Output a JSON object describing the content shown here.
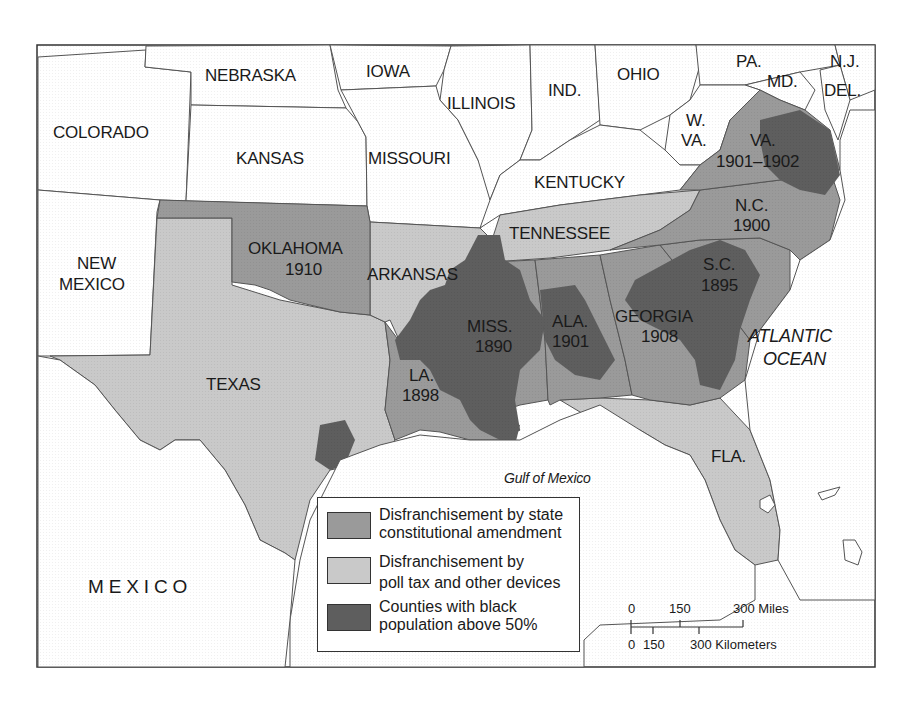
{
  "colors": {
    "constitutional_amendment": "#9a9a9a",
    "poll_tax": "#c9c9c9",
    "black_majority": "#5e5e5e",
    "non_south": "#ffffff",
    "water": "#ffffff",
    "border": "#333333"
  },
  "states": {
    "colorado": "COLORADO",
    "nebraska": "NEBRASKA",
    "iowa": "IOWA",
    "illinois": "ILLINOIS",
    "indiana": "IND.",
    "ohio": "OHIO",
    "pennsylvania": "PA.",
    "maryland": "MD.",
    "new_jersey": "N.J.",
    "delaware": "DEL.",
    "kansas": "KANSAS",
    "missouri": "MISSOURI",
    "west_virginia_1": "W.",
    "west_virginia_2": "VA.",
    "kentucky": "KENTUCKY",
    "virginia": "VA.",
    "virginia_year": "1901–1902",
    "new_mexico_1": "NEW",
    "new_mexico_2": "MEXICO",
    "oklahoma": "OKLAHOMA",
    "oklahoma_year": "1910",
    "arkansas": "ARKANSAS",
    "tennessee": "TENNESSEE",
    "north_carolina": "N.C.",
    "north_carolina_year": "1900",
    "south_carolina": "S.C.",
    "south_carolina_year": "1895",
    "mississippi": "MISS.",
    "mississippi_year": "1890",
    "alabama": "ALA.",
    "alabama_year": "1901",
    "georgia": "GEORGIA",
    "georgia_year": "1908",
    "texas": "TEXAS",
    "louisiana": "LA.",
    "louisiana_year": "1898",
    "florida": "FLA.",
    "mexico": "M E X I C O"
  },
  "water_labels": {
    "atlantic_1": "ATLANTIC",
    "atlantic_2": "OCEAN",
    "gulf": "Gulf of Mexico"
  },
  "legend": {
    "items": [
      {
        "line1": "Disfranchisement by state",
        "line2": "constitutional amendment",
        "color_key": "constitutional_amendment"
      },
      {
        "line1": "Disfranchisement by",
        "line2": "poll tax and other devices",
        "color_key": "poll_tax"
      },
      {
        "line1": "Counties with black",
        "line2": "population above 50%",
        "color_key": "black_majority"
      }
    ]
  },
  "scale_bar": {
    "miles_ticks": [
      "0",
      "150",
      "300 Miles"
    ],
    "km_ticks": [
      "0",
      "150",
      "300 Kilometers"
    ]
  },
  "map_data": {
    "constitutional_amendment_states": [
      {
        "state": "Mississippi",
        "year": "1890"
      },
      {
        "state": "South Carolina",
        "year": "1895"
      },
      {
        "state": "Louisiana",
        "year": "1898"
      },
      {
        "state": "North Carolina",
        "year": "1900"
      },
      {
        "state": "Alabama",
        "year": "1901"
      },
      {
        "state": "Virginia",
        "year": "1901–1902"
      },
      {
        "state": "Georgia",
        "year": "1908"
      },
      {
        "state": "Oklahoma",
        "year": "1910"
      }
    ],
    "poll_tax_states": [
      "Texas",
      "Arkansas",
      "Tennessee",
      "Florida"
    ]
  }
}
